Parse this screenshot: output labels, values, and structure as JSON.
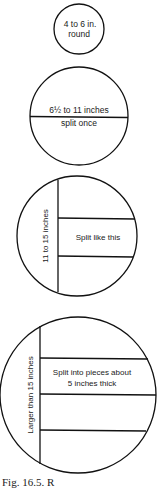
{
  "diagram": {
    "circles": [
      {
        "id": "small",
        "label_line1": "4 to 6 in.",
        "label_line2": "round"
      },
      {
        "id": "medium",
        "label_top": "6½ to 11 inches",
        "label_bottom": "split once"
      },
      {
        "id": "large",
        "side_label": "11 to 15 inches",
        "center_label": "Split like this"
      },
      {
        "id": "xlarge",
        "side_label": "Larger than 15 inches",
        "center_label_line1": "Split into pieces about",
        "center_label_line2": "5 inches thick"
      }
    ],
    "caption": "Fig. 16.5. R"
  }
}
